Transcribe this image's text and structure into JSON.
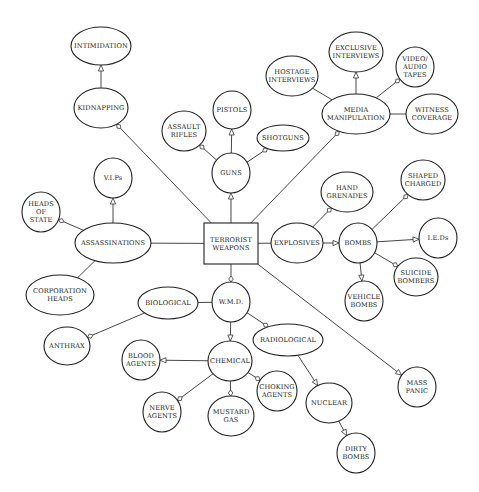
{
  "diagram": {
    "colors": {
      "stroke": "#222222",
      "fill": "#ffffff",
      "text": "#222222",
      "background": "#ffffff"
    },
    "nodes": [
      {
        "id": "terrorist_weapons",
        "shape": "rect",
        "x": 204,
        "y": 223,
        "w": 54,
        "h": 41,
        "lines": [
          "TERRORIST",
          "WEAPONS"
        ]
      },
      {
        "id": "intimidation",
        "shape": "ellipse",
        "cx": 101,
        "cy": 46,
        "rx": 30,
        "ry": 19,
        "lines": [
          "INTIMIDATION"
        ]
      },
      {
        "id": "kidnapping",
        "shape": "ellipse",
        "cx": 101,
        "cy": 108,
        "rx": 27,
        "ry": 20,
        "lines": [
          "KIDNAPPING"
        ]
      },
      {
        "id": "assault_rifles",
        "shape": "ellipse",
        "cx": 184,
        "cy": 131,
        "rx": 22,
        "ry": 20,
        "lines": [
          "ASSAULT",
          "RIFLES"
        ]
      },
      {
        "id": "pistols",
        "shape": "ellipse",
        "cx": 232,
        "cy": 110,
        "rx": 19,
        "ry": 19,
        "lines": [
          "PISTOLS"
        ]
      },
      {
        "id": "shotguns",
        "shape": "ellipse",
        "cx": 283,
        "cy": 138,
        "rx": 26,
        "ry": 13,
        "lines": [
          "SHOTGUNS"
        ]
      },
      {
        "id": "guns",
        "shape": "ellipse",
        "cx": 231,
        "cy": 173,
        "rx": 19,
        "ry": 20,
        "lines": [
          "GUNS"
        ]
      },
      {
        "id": "hostage_interviews",
        "shape": "ellipse",
        "cx": 292,
        "cy": 76,
        "rx": 26,
        "ry": 20,
        "lines": [
          "HOSTAGE",
          "INTERVIEWS"
        ]
      },
      {
        "id": "exclusive_interviews",
        "shape": "ellipse",
        "cx": 356,
        "cy": 52,
        "rx": 27,
        "ry": 20,
        "lines": [
          "EXCLUSIVE",
          "INTERVIEWS"
        ]
      },
      {
        "id": "video_audio_tapes",
        "shape": "ellipse",
        "cx": 415,
        "cy": 67,
        "rx": 19,
        "ry": 20,
        "lines": [
          "VIDEO/",
          "AUDIO",
          "TAPES"
        ]
      },
      {
        "id": "media_manipulation",
        "shape": "ellipse",
        "cx": 356,
        "cy": 114,
        "rx": 34,
        "ry": 20,
        "lines": [
          "MEDIA",
          "MANIPULATION"
        ]
      },
      {
        "id": "witness_coverage",
        "shape": "ellipse",
        "cx": 432,
        "cy": 114,
        "rx": 26,
        "ry": 20,
        "lines": [
          "WITNESS",
          "COVERAGE"
        ]
      },
      {
        "id": "vips",
        "shape": "ellipse",
        "cx": 113,
        "cy": 178,
        "rx": 19,
        "ry": 20,
        "lines": [
          "V.I.Ps"
        ]
      },
      {
        "id": "heads_of_state",
        "shape": "ellipse",
        "cx": 41,
        "cy": 212,
        "rx": 19,
        "ry": 20,
        "lines": [
          "HEADS",
          "OF",
          "STATE"
        ]
      },
      {
        "id": "assassinations",
        "shape": "ellipse",
        "cx": 113,
        "cy": 243,
        "rx": 38,
        "ry": 20,
        "lines": [
          "ASSASSINATIONS"
        ]
      },
      {
        "id": "corporation_heads",
        "shape": "ellipse",
        "cx": 60,
        "cy": 295,
        "rx": 34,
        "ry": 20,
        "lines": [
          "CORPORATION",
          "HEADS"
        ]
      },
      {
        "id": "explosives",
        "shape": "ellipse",
        "cx": 297,
        "cy": 243,
        "rx": 26,
        "ry": 20,
        "lines": [
          "EXPLOSIVES"
        ]
      },
      {
        "id": "hand_grenades",
        "shape": "ellipse",
        "cx": 347,
        "cy": 192,
        "rx": 26,
        "ry": 20,
        "lines": [
          "HAND",
          "GRENADES"
        ]
      },
      {
        "id": "bombs",
        "shape": "ellipse",
        "cx": 358,
        "cy": 243,
        "rx": 19,
        "ry": 20,
        "lines": [
          "BOMBS"
        ]
      },
      {
        "id": "shaped_charged",
        "shape": "ellipse",
        "cx": 423,
        "cy": 180,
        "rx": 22,
        "ry": 20,
        "lines": [
          "SHAPED",
          "CHARGED"
        ]
      },
      {
        "id": "ieds",
        "shape": "ellipse",
        "cx": 438,
        "cy": 238,
        "rx": 19,
        "ry": 20,
        "lines": [
          "I.E.Ds"
        ]
      },
      {
        "id": "suicide_bombers",
        "shape": "ellipse",
        "cx": 416,
        "cy": 277,
        "rx": 22,
        "ry": 19,
        "lines": [
          "SUICIDE",
          "BOMBERS"
        ]
      },
      {
        "id": "vehicle_bombs",
        "shape": "ellipse",
        "cx": 364,
        "cy": 301,
        "rx": 19,
        "ry": 20,
        "lines": [
          "VEHICLE",
          "BOMBS"
        ]
      },
      {
        "id": "biological",
        "shape": "ellipse",
        "cx": 168,
        "cy": 303,
        "rx": 30,
        "ry": 16,
        "lines": [
          "BIOLOGICAL"
        ]
      },
      {
        "id": "wmd",
        "shape": "ellipse",
        "cx": 231,
        "cy": 302,
        "rx": 19,
        "ry": 20,
        "lines": [
          "W.M.D."
        ]
      },
      {
        "id": "anthrax",
        "shape": "ellipse",
        "cx": 67,
        "cy": 346,
        "rx": 23,
        "ry": 19,
        "lines": [
          "ANTHRAX"
        ]
      },
      {
        "id": "radiological",
        "shape": "ellipse",
        "cx": 288,
        "cy": 340,
        "rx": 35,
        "ry": 16,
        "lines": [
          "RADIOLOGICAL"
        ]
      },
      {
        "id": "blood_agents",
        "shape": "ellipse",
        "cx": 141,
        "cy": 360,
        "rx": 19,
        "ry": 20,
        "lines": [
          "BLOOD",
          "AGENTS"
        ]
      },
      {
        "id": "chemical",
        "shape": "ellipse",
        "cx": 230,
        "cy": 361,
        "rx": 22,
        "ry": 20,
        "lines": [
          "CHEMICAL"
        ]
      },
      {
        "id": "choking_agents",
        "shape": "ellipse",
        "cx": 277,
        "cy": 391,
        "rx": 20,
        "ry": 20,
        "lines": [
          "CHOKING",
          "AGENTS"
        ]
      },
      {
        "id": "nerve_agents",
        "shape": "ellipse",
        "cx": 162,
        "cy": 412,
        "rx": 19,
        "ry": 20,
        "lines": [
          "NERVE",
          "AGENTS"
        ]
      },
      {
        "id": "mustard_gas",
        "shape": "ellipse",
        "cx": 231,
        "cy": 416,
        "rx": 23,
        "ry": 20,
        "lines": [
          "MUSTARD",
          "GAS"
        ]
      },
      {
        "id": "nuclear",
        "shape": "ellipse",
        "cx": 329,
        "cy": 403,
        "rx": 23,
        "ry": 20,
        "lines": [
          "NUCLEAR"
        ]
      },
      {
        "id": "mass_panic",
        "shape": "ellipse",
        "cx": 417,
        "cy": 387,
        "rx": 19,
        "ry": 20,
        "lines": [
          "MASS",
          "PANIC"
        ]
      },
      {
        "id": "dirty_bombs",
        "shape": "ellipse",
        "cx": 356,
        "cy": 453,
        "rx": 19,
        "ry": 20,
        "lines": [
          "DIRTY",
          "BOMBS"
        ]
      }
    ],
    "edges": [
      {
        "from": "kidnapping",
        "to": "intimidation",
        "head": "triangle"
      },
      {
        "from": "terrorist_weapons",
        "to": "kidnapping",
        "head": "diamond"
      },
      {
        "from": "terrorist_weapons",
        "to": "guns",
        "head": "triangle"
      },
      {
        "from": "guns",
        "to": "assault_rifles",
        "head": "diamond"
      },
      {
        "from": "guns",
        "to": "pistols",
        "head": "triangle"
      },
      {
        "from": "guns",
        "to": "shotguns",
        "head": "diamond"
      },
      {
        "from": "terrorist_weapons",
        "to": "media_manipulation",
        "head": "diamond"
      },
      {
        "from": "media_manipulation",
        "to": "hostage_interviews",
        "head": "none"
      },
      {
        "from": "media_manipulation",
        "to": "exclusive_interviews",
        "head": "triangle"
      },
      {
        "from": "media_manipulation",
        "to": "video_audio_tapes",
        "head": "diamond"
      },
      {
        "from": "media_manipulation",
        "to": "witness_coverage",
        "head": "none"
      },
      {
        "from": "terrorist_weapons",
        "to": "assassinations",
        "head": "none"
      },
      {
        "from": "assassinations",
        "to": "vips",
        "head": "triangle"
      },
      {
        "from": "assassinations",
        "to": "heads_of_state",
        "head": "diamond"
      },
      {
        "from": "assassinations",
        "to": "corporation_heads",
        "head": "none"
      },
      {
        "from": "terrorist_weapons",
        "to": "explosives",
        "head": "none"
      },
      {
        "from": "explosives",
        "to": "hand_grenades",
        "head": "diamond"
      },
      {
        "from": "explosives",
        "to": "bombs",
        "head": "triangle"
      },
      {
        "from": "bombs",
        "to": "shaped_charged",
        "head": "diamond"
      },
      {
        "from": "bombs",
        "to": "ieds",
        "head": "triangle"
      },
      {
        "from": "bombs",
        "to": "suicide_bombers",
        "head": "diamond"
      },
      {
        "from": "bombs",
        "to": "vehicle_bombs",
        "head": "triangle"
      },
      {
        "from": "terrorist_weapons",
        "to": "wmd",
        "head": "diamond"
      },
      {
        "from": "wmd",
        "to": "biological",
        "head": "none"
      },
      {
        "from": "biological",
        "to": "anthrax",
        "head": "diamond"
      },
      {
        "from": "wmd",
        "to": "radiological",
        "head": "diamond"
      },
      {
        "from": "wmd",
        "to": "chemical",
        "head": "triangle"
      },
      {
        "from": "chemical",
        "to": "blood_agents",
        "head": "triangle"
      },
      {
        "from": "chemical",
        "to": "choking_agents",
        "head": "diamond"
      },
      {
        "from": "chemical",
        "to": "nerve_agents",
        "head": "diamond"
      },
      {
        "from": "chemical",
        "to": "mustard_gas",
        "head": "diamond"
      },
      {
        "from": "radiological",
        "to": "nuclear",
        "head": "triangle"
      },
      {
        "from": "nuclear",
        "to": "dirty_bombs",
        "head": "triangle"
      },
      {
        "from": "terrorist_weapons",
        "to": "mass_panic",
        "head": "triangle"
      }
    ]
  }
}
